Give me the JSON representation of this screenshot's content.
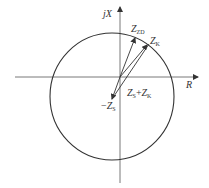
{
  "diagram": {
    "type": "impedance-plane circle diagram",
    "axes": {
      "horizontal_label": "R",
      "vertical_label": "jX"
    },
    "labels": {
      "zzd": {
        "main": "Z",
        "sub": "ZD"
      },
      "zk": {
        "main": "Z",
        "sub": "K"
      },
      "zs_plus_zk": {
        "a_main": "Z",
        "a_sub": "S",
        "op": "+",
        "b_main": "Z",
        "b_sub": "K"
      },
      "neg_zs": {
        "prefix": "−",
        "main": "Z",
        "sub": "S"
      }
    },
    "colors": {
      "line": "#333333",
      "background": "#ffffff"
    }
  }
}
